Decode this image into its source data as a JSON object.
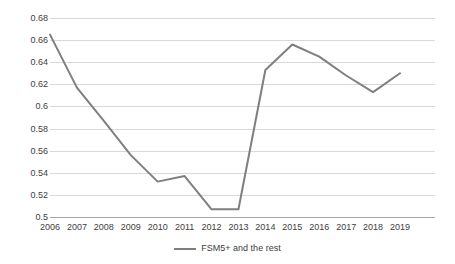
{
  "chart_data": {
    "type": "line",
    "title": "",
    "xlabel": "",
    "ylabel": "",
    "categories": [
      "2006",
      "2007",
      "2008",
      "2009",
      "2010",
      "2011",
      "2012",
      "2013",
      "2014",
      "2015",
      "2016",
      "2017",
      "2018",
      "2019"
    ],
    "series": [
      {
        "name": "FSM5+ and the rest",
        "color": "#7f7f7f",
        "values": [
          0.665,
          0.617,
          0.587,
          0.556,
          0.532,
          0.537,
          0.507,
          0.507,
          0.633,
          0.656,
          0.645,
          0.628,
          0.613,
          0.63
        ]
      }
    ],
    "ylim": [
      0.5,
      0.68
    ],
    "ytick_labels": [
      "0.68",
      "0.66",
      "0.64",
      "0.62",
      "0.6",
      "0.58",
      "0.56",
      "0.54",
      "0.52",
      "0.5"
    ],
    "ytick_values": [
      0.68,
      0.66,
      0.64,
      0.62,
      0.6,
      0.58,
      0.56,
      0.54,
      0.52,
      0.5
    ],
    "grid": true,
    "grid_color": "#d9d9d9",
    "legend_position": "bottom",
    "legend_entries": [
      "FSM5+ and the rest"
    ]
  },
  "legend": {
    "label": "FSM5+ and the rest"
  }
}
